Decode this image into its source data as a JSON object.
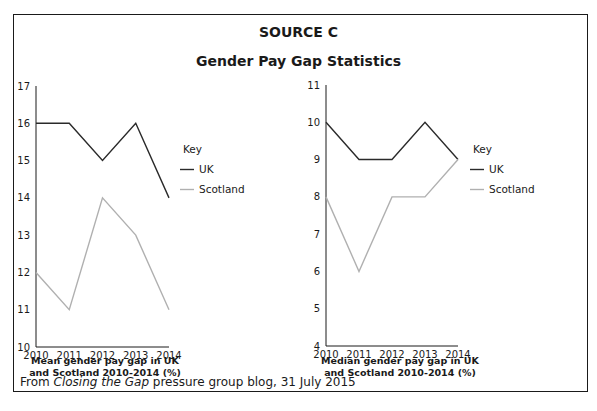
{
  "header": {
    "source_label": "SOURCE C",
    "title": "Gender Pay Gap Statistics"
  },
  "footer": {
    "prefix": "From ",
    "publication": "Closing the Gap",
    "suffix": " pressure group blog, 31 July 2015"
  },
  "colors": {
    "uk": "#2a2a2a",
    "scotland": "#b0b0b0",
    "axis": "#1a1a1a"
  },
  "chart_data": [
    {
      "type": "line",
      "title": "Mean gender pay gap in UK and Scotland 2010-2014 (%)",
      "caption_line1": "Mean gender pay gap in UK",
      "caption_line2": "and Scotland 2010-2014 (%)",
      "xlabel": "",
      "ylabel": "",
      "x": [
        "2010",
        "2011",
        "2012",
        "2013",
        "2014"
      ],
      "ylim": [
        10,
        17
      ],
      "yticks": [
        10,
        11,
        12,
        13,
        14,
        15,
        16,
        17
      ],
      "grid": false,
      "legend_title": "Key",
      "legend_position": "right",
      "series": [
        {
          "name": "UK",
          "values": [
            16,
            16,
            15,
            16,
            14
          ]
        },
        {
          "name": "Scotland",
          "values": [
            12,
            11,
            14,
            13,
            11
          ]
        }
      ]
    },
    {
      "type": "line",
      "title": "Median gender pay gap in UK and Scotland 2010-2014 (%)",
      "caption_line1": "Median gender pay gap in UK",
      "caption_line2": "and Scotland 2010-2014 (%)",
      "xlabel": "",
      "ylabel": "",
      "x": [
        "2010",
        "2011",
        "2012",
        "2013",
        "2014"
      ],
      "ylim": [
        4,
        11
      ],
      "yticks": [
        4,
        5,
        6,
        7,
        8,
        9,
        10,
        11
      ],
      "grid": false,
      "legend_title": "Key",
      "legend_position": "right",
      "series": [
        {
          "name": "UK",
          "values": [
            10,
            9,
            9,
            10,
            9
          ]
        },
        {
          "name": "Scotland",
          "values": [
            8,
            6,
            8,
            8,
            9
          ]
        }
      ]
    }
  ]
}
